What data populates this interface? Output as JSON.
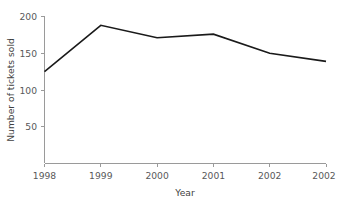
{
  "chart_data": {
    "type": "line",
    "title": "",
    "subtitle": "",
    "xlabel": "Year",
    "ylabel": "Number of tickets sold",
    "categories": [
      "1998",
      "1999",
      "2000",
      "2001",
      "2002",
      "2002"
    ],
    "values": [
      125,
      188,
      171,
      176,
      150,
      139
    ],
    "series": [
      {
        "name": "Number of tickets sold",
        "values": [
          125,
          188,
          171,
          176,
          150,
          139
        ]
      }
    ],
    "x_tick_labels": [
      "1998",
      "1999",
      "2000",
      "2001",
      "2002",
      "2002"
    ],
    "y_tick_labels": [
      "50",
      "100",
      "150",
      "200"
    ],
    "y_tick_values": [
      50,
      100,
      150,
      200
    ],
    "ylim": [
      0,
      200
    ],
    "xlim": [
      0,
      5
    ],
    "grid": false,
    "legend": false,
    "legend_position": "none",
    "line_color": "#1a1a1a",
    "axis_color": "#9a9a9a",
    "text_color": "#58585a",
    "background_color": "#ffffff"
  },
  "axes": {
    "y_title": "Number of tickets sold",
    "x_title": "Year"
  },
  "ticks": {
    "y": [
      {
        "label": "200",
        "value": 200
      },
      {
        "label": "150",
        "value": 150
      },
      {
        "label": "100",
        "value": 100
      },
      {
        "label": "50",
        "value": 50
      }
    ],
    "x": [
      {
        "label": "1998",
        "index": 0
      },
      {
        "label": "1999",
        "index": 1
      },
      {
        "label": "2000",
        "index": 2
      },
      {
        "label": "2001",
        "index": 3
      },
      {
        "label": "2002",
        "index": 4
      },
      {
        "label": "2002",
        "index": 5
      }
    ]
  }
}
